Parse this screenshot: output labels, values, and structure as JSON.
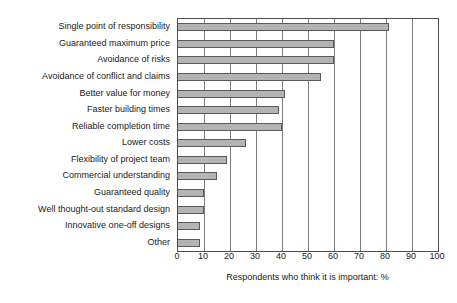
{
  "chart_data": {
    "type": "bar",
    "orientation": "horizontal",
    "title": "",
    "xlabel": "Respondents who think it is important: %",
    "ylabel": "",
    "xlim": [
      0,
      100
    ],
    "xticks": [
      0,
      10,
      20,
      30,
      40,
      50,
      60,
      70,
      80,
      90,
      100
    ],
    "grid": true,
    "legend": false,
    "categories": [
      "Single point of responsibility",
      "Guaranteed maximum price",
      "Avoidance of risks",
      "Avoidance of conflict and claims",
      "Better value for money",
      "Faster building times",
      "Reliable completion time",
      "Lower costs",
      "Flexibility of project team",
      "Commercial understanding",
      "Guaranteed quality",
      "Well thought-out standard design",
      "Innovative one-off designs",
      "Other"
    ],
    "values": [
      81,
      60,
      60,
      55,
      41,
      39,
      40,
      26,
      19,
      15,
      10,
      10,
      8.5,
      8.5
    ],
    "bar_fill_color": "#b4b4b4",
    "bar_edge_color": "#5a5a5a",
    "grid_color": "#7d7d7d",
    "axis_color": "#4d4d4d"
  }
}
